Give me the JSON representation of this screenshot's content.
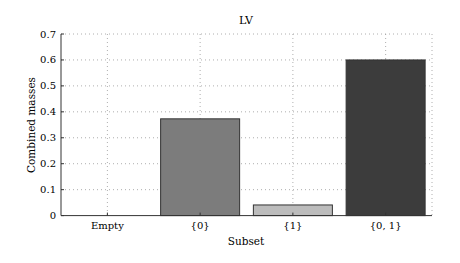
{
  "chart_data": {
    "type": "bar",
    "title": "LV",
    "xlabel": "Subset",
    "ylabel": "Combined masses",
    "categories": [
      "Empty",
      "{0}",
      "{1}",
      "{0, 1}"
    ],
    "values": [
      0.0,
      0.373,
      0.041,
      0.6
    ],
    "colors": [
      "#ffffff",
      "#7c7c7c",
      "#bcbcbc",
      "#3c3c3c"
    ],
    "ylim": [
      0,
      0.7
    ],
    "yticks": [
      "0",
      "0.1",
      "0.2",
      "0.3",
      "0.4",
      "0.5",
      "0.6",
      "0.7"
    ],
    "grid": true,
    "legend": null
  }
}
